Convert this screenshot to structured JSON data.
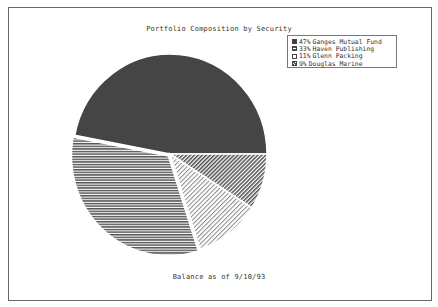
{
  "chart_data": {
    "type": "pie",
    "title": "Portfolio Composition by Security",
    "footer": "Balance as of  9/10/93",
    "categories": [
      "Ganges Mutual Fund",
      "Haven Publishing",
      "Glenn Packing",
      "Douglas Marine"
    ],
    "values": [
      47,
      33,
      11,
      9
    ],
    "value_labels": [
      "47%",
      "33%",
      "11%",
      " 9%"
    ],
    "units": "percent",
    "legend_position": "upper-right",
    "fills": [
      {
        "pattern": "solid-dark",
        "color": "#4a4a4a"
      },
      {
        "pattern": "horizontal-lines",
        "color": "#555555"
      },
      {
        "pattern": "diagonal-light",
        "color": "#888888"
      },
      {
        "pattern": "diagonal-dense",
        "color": "#555555"
      }
    ]
  },
  "legend": {
    "items": [
      {
        "pct": "47%",
        "label": "Ganges Mutual Fund"
      },
      {
        "pct": "33%",
        "label": "Haven Publishing"
      },
      {
        "pct": "11%",
        "label": "Glenn Packing"
      },
      {
        "pct": " 9%",
        "label": "Douglas Marine"
      }
    ]
  }
}
